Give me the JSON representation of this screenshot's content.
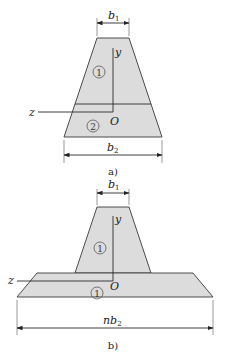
{
  "figure_a": {
    "caption": "a)",
    "top_width_label": "b",
    "top_width_sub": "1",
    "bottom_width_label": "b",
    "bottom_width_sub": "2",
    "region_upper": "1",
    "region_lower": "2",
    "axis_y": "y",
    "axis_z": "z",
    "origin": "O"
  },
  "figure_b": {
    "caption": "b)",
    "top_width_label": "b",
    "top_width_sub": "1",
    "bottom_width_label": "nb",
    "bottom_width_sub": "2",
    "region_upper": "1",
    "region_lower": "1",
    "axis_y": "y",
    "axis_z": "z",
    "origin": "O"
  },
  "colors": {
    "fill": "#dcdcdc",
    "stroke": "#3a3a3a"
  }
}
